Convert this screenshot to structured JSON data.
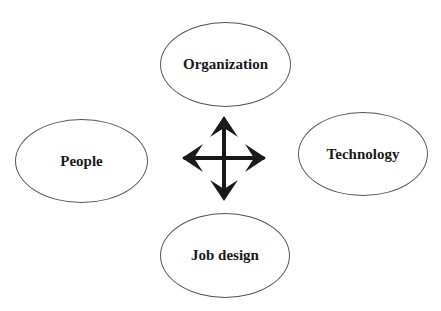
{
  "diagram": {
    "nodes": [
      {
        "id": "organization",
        "label": "Organization",
        "x": 160,
        "y": 22,
        "w": 131,
        "h": 85
      },
      {
        "id": "people",
        "label": "People",
        "x": 15,
        "y": 119,
        "w": 133,
        "h": 84
      },
      {
        "id": "technology",
        "label": "Technology",
        "x": 298,
        "y": 112,
        "w": 130,
        "h": 84
      },
      {
        "id": "job-design",
        "label": "Job design",
        "x": 160,
        "y": 213,
        "w": 130,
        "h": 85
      }
    ],
    "connector": {
      "type": "four-way-arrow",
      "center": [
        224,
        158
      ],
      "color": "#1a1a1a"
    }
  }
}
